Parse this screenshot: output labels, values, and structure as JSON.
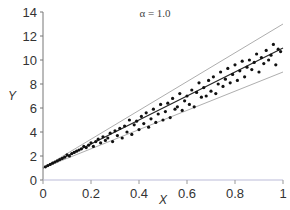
{
  "chart_data": {
    "type": "scatter",
    "title": "α = 1.0",
    "xlabel": "X",
    "ylabel": "Y",
    "xlim": [
      0,
      1
    ],
    "ylim": [
      0,
      14
    ],
    "xticks": [
      "0",
      "0.2",
      "0.4",
      "0.6",
      "0.8",
      "1"
    ],
    "yticks": [
      "0",
      "2",
      "4",
      "6",
      "8",
      "10",
      "12",
      "14"
    ],
    "grid": false,
    "legend": null,
    "series": [
      {
        "name": "mean",
        "kind": "line",
        "x": [
          0,
          1
        ],
        "y": [
          1.0,
          11.0
        ]
      },
      {
        "name": "upper bound",
        "kind": "line",
        "x": [
          0,
          1
        ],
        "y": [
          1.0,
          13.0
        ]
      },
      {
        "name": "lower bound",
        "kind": "line",
        "x": [
          0,
          1
        ],
        "y": [
          1.0,
          9.0
        ]
      },
      {
        "name": "samples",
        "kind": "scatter",
        "x": [
          0.01,
          0.02,
          0.03,
          0.04,
          0.05,
          0.06,
          0.07,
          0.08,
          0.09,
          0.1,
          0.11,
          0.12,
          0.13,
          0.14,
          0.15,
          0.16,
          0.17,
          0.18,
          0.19,
          0.2,
          0.21,
          0.22,
          0.23,
          0.24,
          0.25,
          0.26,
          0.27,
          0.28,
          0.29,
          0.3,
          0.31,
          0.32,
          0.33,
          0.34,
          0.35,
          0.36,
          0.37,
          0.38,
          0.39,
          0.4,
          0.41,
          0.42,
          0.43,
          0.44,
          0.45,
          0.46,
          0.47,
          0.48,
          0.49,
          0.5,
          0.51,
          0.52,
          0.53,
          0.54,
          0.55,
          0.56,
          0.57,
          0.58,
          0.59,
          0.6,
          0.61,
          0.62,
          0.63,
          0.64,
          0.65,
          0.66,
          0.67,
          0.68,
          0.69,
          0.7,
          0.71,
          0.72,
          0.73,
          0.74,
          0.75,
          0.76,
          0.77,
          0.78,
          0.79,
          0.8,
          0.81,
          0.82,
          0.83,
          0.84,
          0.85,
          0.86,
          0.87,
          0.88,
          0.89,
          0.9,
          0.91,
          0.92,
          0.93,
          0.94,
          0.95,
          0.96,
          0.97,
          0.98,
          0.99
        ],
        "y": [
          1.1,
          1.2,
          1.3,
          1.4,
          1.5,
          1.6,
          1.7,
          1.8,
          1.9,
          2.1,
          2.0,
          2.2,
          2.3,
          2.4,
          2.5,
          2.6,
          2.8,
          2.7,
          2.9,
          3.1,
          2.8,
          3.2,
          3.4,
          3.1,
          3.6,
          3.3,
          3.5,
          3.9,
          3.2,
          4.1,
          3.7,
          4.3,
          3.5,
          4.5,
          4.0,
          5.0,
          3.8,
          4.6,
          4.9,
          4.2,
          5.3,
          4.7,
          5.6,
          4.4,
          5.1,
          5.9,
          4.8,
          5.5,
          6.3,
          5.0,
          5.7,
          6.4,
          5.2,
          6.8,
          5.9,
          6.1,
          7.2,
          5.8,
          6.6,
          7.0,
          6.3,
          7.5,
          6.1,
          7.3,
          8.1,
          6.9,
          7.7,
          7.0,
          8.3,
          7.4,
          8.6,
          7.2,
          8.0,
          9.0,
          7.8,
          8.4,
          9.3,
          8.1,
          8.8,
          9.6,
          8.3,
          9.1,
          9.9,
          8.6,
          9.4,
          10.0,
          9.2,
          9.8,
          10.5,
          9.0,
          10.2,
          9.7,
          10.8,
          10.0,
          10.4,
          11.3,
          9.6,
          10.9,
          10.7
        ]
      }
    ]
  }
}
